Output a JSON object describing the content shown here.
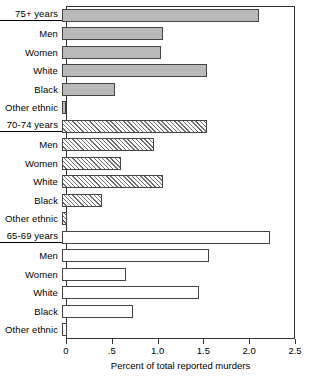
{
  "chart_data": {
    "type": "bar",
    "orientation": "horizontal",
    "title": "",
    "xlabel": "Percent of total reported murders",
    "ylabel": "",
    "xlim": [
      0,
      2.5
    ],
    "xticks": [
      0,
      0.5,
      1.0,
      1.5,
      2.0,
      2.5
    ],
    "xtick_labels": [
      "0",
      ".5",
      "1.0",
      "1.5",
      "2.0",
      "2.5"
    ],
    "grid": false,
    "legend": "none",
    "categories": [
      "75+ years",
      "Men",
      "Women",
      "White",
      "Black",
      "Other ethnic",
      "70-74 years",
      "Men",
      "Women",
      "White",
      "Black",
      "Other ethnic",
      "65-69 years",
      "Men",
      "Women",
      "White",
      "Black",
      "Other ethnic"
    ],
    "values": [
      2.15,
      1.1,
      1.08,
      1.58,
      0.58,
      0.04,
      1.58,
      1.0,
      0.64,
      1.1,
      0.44,
      0.05,
      2.27,
      1.6,
      0.7,
      1.5,
      0.77,
      0.05
    ],
    "series": [
      {
        "name": "75+ years",
        "style": "solid-gray",
        "fill": "#b9b9b9",
        "items": [
          {
            "label": "75+ years",
            "value": 2.15,
            "group_header": true
          },
          {
            "label": "Men",
            "value": 1.1,
            "group_header": false
          },
          {
            "label": "Women",
            "value": 1.08,
            "group_header": false
          },
          {
            "label": "White",
            "value": 1.58,
            "group_header": false
          },
          {
            "label": "Black",
            "value": 0.58,
            "group_header": false
          },
          {
            "label": "Other ethnic",
            "value": 0.04,
            "group_header": false
          }
        ]
      },
      {
        "name": "70-74 years",
        "style": "hatched",
        "fill": "#ffffff",
        "items": [
          {
            "label": "70-74 years",
            "value": 1.58,
            "group_header": true
          },
          {
            "label": "Men",
            "value": 1.0,
            "group_header": false
          },
          {
            "label": "Women",
            "value": 0.64,
            "group_header": false
          },
          {
            "label": "White",
            "value": 1.1,
            "group_header": false
          },
          {
            "label": "Black",
            "value": 0.44,
            "group_header": false
          },
          {
            "label": "Other ethnic",
            "value": 0.05,
            "group_header": false
          }
        ]
      },
      {
        "name": "65-69 years",
        "style": "open",
        "fill": "#ffffff",
        "items": [
          {
            "label": "65-69 years",
            "value": 2.27,
            "group_header": true
          },
          {
            "label": "Men",
            "value": 1.6,
            "group_header": false
          },
          {
            "label": "Women",
            "value": 0.7,
            "group_header": false
          },
          {
            "label": "White",
            "value": 1.5,
            "group_header": false
          },
          {
            "label": "Black",
            "value": 0.77,
            "group_header": false
          },
          {
            "label": "Other ethnic",
            "value": 0.05,
            "group_header": false
          }
        ]
      }
    ]
  }
}
